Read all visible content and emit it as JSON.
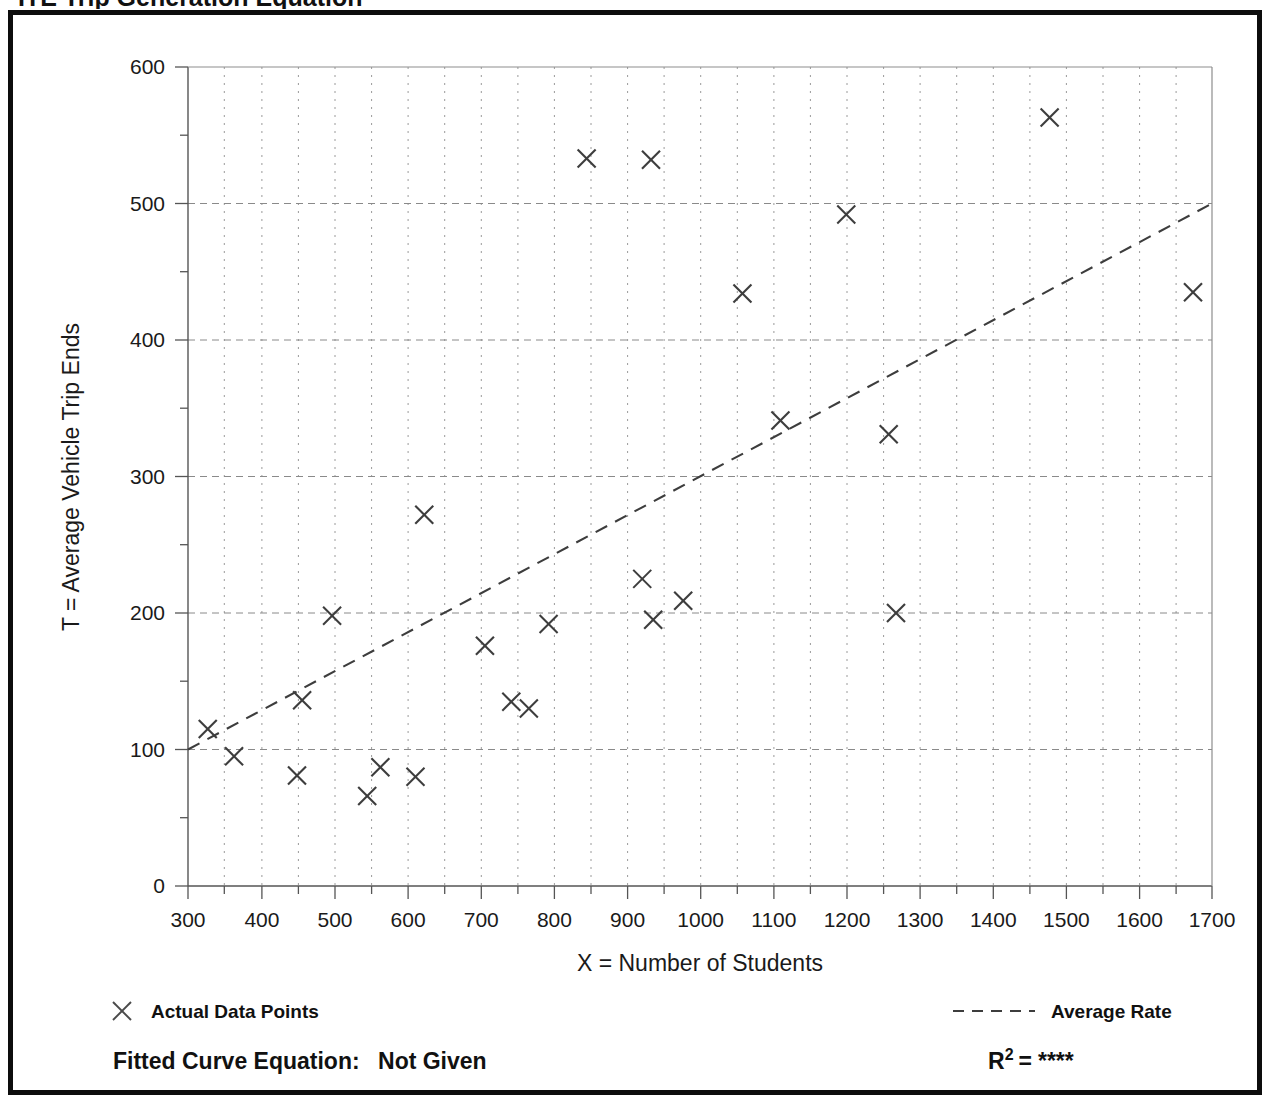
{
  "page": {
    "clipped_heading": "ITE Trip Generation Equation"
  },
  "chart_data": {
    "type": "scatter",
    "title": "",
    "xlabel": "X = Number of Students",
    "ylabel": "T = Average Vehicle Trip Ends",
    "xlim": [
      300,
      1700
    ],
    "ylim": [
      0,
      600
    ],
    "x_ticks": [
      300,
      400,
      500,
      600,
      700,
      800,
      900,
      1000,
      1100,
      1200,
      1300,
      1400,
      1500,
      1600,
      1700
    ],
    "y_ticks": [
      0,
      100,
      200,
      300,
      400,
      500,
      600
    ],
    "x_minor_step": 50,
    "y_minor_step": 50,
    "grid": "major dashed, minor dotted",
    "legend_position": "below-axes",
    "series": [
      {
        "name": "Actual Data Points",
        "marker": "x",
        "points": [
          [
            327,
            115
          ],
          [
            363,
            95
          ],
          [
            449,
            81
          ],
          [
            497,
            198
          ],
          [
            456,
            136
          ],
          [
            545,
            66
          ],
          [
            563,
            87
          ],
          [
            611,
            80
          ],
          [
            623,
            272
          ],
          [
            706,
            176
          ],
          [
            742,
            135
          ],
          [
            766,
            130
          ],
          [
            793,
            192
          ],
          [
            845,
            533
          ],
          [
            921,
            225
          ],
          [
            933,
            532
          ],
          [
            936,
            195
          ],
          [
            977,
            209
          ],
          [
            1058,
            434
          ],
          [
            1110,
            341
          ],
          [
            1200,
            492
          ],
          [
            1258,
            331
          ],
          [
            1268,
            200
          ],
          [
            1478,
            563
          ],
          [
            1674,
            435
          ]
        ]
      },
      {
        "name": "Average Rate",
        "type": "line",
        "style": "dashed",
        "endpoints": [
          [
            300,
            100
          ],
          [
            1700,
            500
          ]
        ]
      }
    ]
  },
  "legend": {
    "data_points_label": "Actual Data Points",
    "average_rate_label": "Average Rate",
    "data_points_marker": "x-marker-icon",
    "average_rate_marker": "dashed-line-icon"
  },
  "footer": {
    "fitted_curve_label": "Fitted Curve Equation:",
    "fitted_curve_value": "Not Given",
    "r2_symbol": "R",
    "r2_exponent": "2",
    "r2_equals": "=",
    "r2_value": "****"
  }
}
